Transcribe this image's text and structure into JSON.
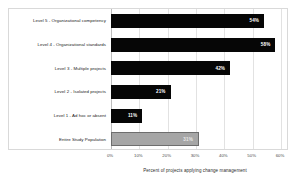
{
  "chart_data": {
    "type": "bar",
    "orientation": "horizontal",
    "title": "",
    "xlabel": "Percent of projects applying change management",
    "ylabel": "",
    "xlim": [
      0,
      60
    ],
    "xticks": [
      "0%",
      "10%",
      "20%",
      "30%",
      "40%",
      "50%",
      "60%"
    ],
    "xtick_values": [
      0,
      10,
      20,
      30,
      40,
      50,
      60
    ],
    "grid": true,
    "legend": "none",
    "categories": [
      "Level 5 - Organizational competency",
      "Level 4 - Organizational standards",
      "Level 3 - Multiple projects",
      "Level 2 - Isolated projects",
      "Level 1 - Ad hoc or absent",
      "Entire Study Population"
    ],
    "values": [
      54,
      58,
      42,
      21,
      11,
      31
    ],
    "data_labels": [
      "54%",
      "58%",
      "42%",
      "21%",
      "11%",
      "31%"
    ],
    "bar_styles": [
      "dark",
      "dark",
      "dark",
      "dark",
      "dark",
      "light"
    ],
    "colors": {
      "bar_dark": "#060606",
      "bar_light": "#a6a6a6",
      "bar_light_border": "#6e6e6e",
      "gridline": "#e2e2e2",
      "frame": "#d9d9d9",
      "background": "#ffffff",
      "label_text": "#1a1a1a",
      "value_text": "#ffffff"
    }
  }
}
